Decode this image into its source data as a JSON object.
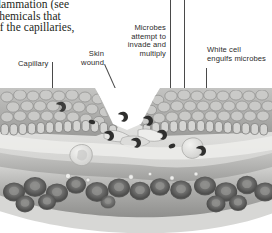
{
  "page": {
    "kind": "textbook-figure",
    "background": "#ffffff",
    "width": 272,
    "height": 233
  },
  "body_text": {
    "lines": [
      "flammation (see",
      "chemicals that",
      "of the capillaries,"
    ]
  },
  "labels": {
    "capillary": "Capillary",
    "skin_wound": "Skin\nwound",
    "skin_wound_lines": [
      "Skin",
      "wound"
    ],
    "microbes": "Microbes\nattempt to\ninvade and\nmultiply",
    "microbes_lines": [
      "Microbes",
      "attempt to",
      "invade and",
      "multiply"
    ],
    "white_cell": "White cell\nengulfs microbes",
    "white_cell_lines": [
      "White cell",
      "engulfs microbes"
    ]
  },
  "colors": {
    "text": "#231f20",
    "label_text": "#2b2b2b",
    "leader_line": "#4a4a4a",
    "epidermis_light": "#d9d9d7",
    "epidermis_mid": "#b3b3b1",
    "epidermis_dark": "#8f8f8d",
    "dermis": "#c9c9c7",
    "vessel_wall": "#a8a8a6",
    "vessel_lumen": "#bdbdbb",
    "rbc_dark": "#5f5f5e",
    "rbc_mid": "#8a8a88",
    "microbe": "#3a3a39",
    "wound_gap": "#ffffff",
    "white_cell": "#e8e8e6"
  },
  "illustration": {
    "title": "Skin wound cross-section with capillary and inflammatory response",
    "structures": [
      "epidermis stratified cell layer",
      "basal columnar cell layer",
      "wound gap",
      "dermis",
      "capillary lumen",
      "red blood cells",
      "microbes",
      "white blood cell emerging through vessel wall"
    ],
    "red_blood_cells": 24,
    "microbes": 9
  }
}
